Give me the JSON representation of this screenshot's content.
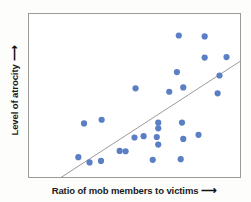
{
  "figure": {
    "background_color": "#fdfdfc",
    "plot_background_color": "#ffffff",
    "frame_color": "#9a9a9a"
  },
  "axes": {
    "x_label": "Ratio of mob members to victims",
    "y_label": "Level of atrocity",
    "x_arrow": "⟶",
    "y_arrow": "⟶"
  },
  "chart_data": {
    "type": "scatter",
    "title": "",
    "xlabel": "Ratio of mob members to victims",
    "ylabel": "Level of atrocity",
    "xlim": [
      0,
      10
    ],
    "ylim": [
      0,
      10
    ],
    "grid": false,
    "legend": null,
    "axis_ticks": {
      "x": [],
      "y": []
    },
    "marker": {
      "color": "#5b7fc4",
      "shape": "circle",
      "radius_px": 3.1
    },
    "points": [
      {
        "x": 7.09,
        "y": 8.66
      },
      {
        "x": 8.31,
        "y": 8.6
      },
      {
        "x": 8.31,
        "y": 7.31
      },
      {
        "x": 9.34,
        "y": 7.34
      },
      {
        "x": 7.0,
        "y": 6.43
      },
      {
        "x": 5.05,
        "y": 5.44
      },
      {
        "x": 7.3,
        "y": 5.49
      },
      {
        "x": 6.64,
        "y": 5.23
      },
      {
        "x": 8.92,
        "y": 5.13
      },
      {
        "x": 9.01,
        "y": 6.22
      },
      {
        "x": 6.12,
        "y": 3.34
      },
      {
        "x": 6.12,
        "y": 3.0
      },
      {
        "x": 7.24,
        "y": 3.35
      },
      {
        "x": 3.45,
        "y": 3.52
      },
      {
        "x": 5.43,
        "y": 2.52
      },
      {
        "x": 6.05,
        "y": 2.47
      },
      {
        "x": 5.0,
        "y": 2.44
      },
      {
        "x": 6.12,
        "y": 2.01
      },
      {
        "x": 7.3,
        "y": 2.35
      },
      {
        "x": 8.02,
        "y": 2.6
      },
      {
        "x": 4.58,
        "y": 1.6
      },
      {
        "x": 4.3,
        "y": 1.62
      },
      {
        "x": 5.86,
        "y": 1.08
      },
      {
        "x": 7.18,
        "y": 1.12
      },
      {
        "x": 3.42,
        "y": 1.01
      },
      {
        "x": 2.88,
        "y": 0.92
      },
      {
        "x": 2.62,
        "y": 3.3
      },
      {
        "x": 2.35,
        "y": 1.24
      }
    ],
    "trend_line": {
      "type": "linear-fit",
      "color": "#9b9b9b",
      "start": {
        "x": 1.53,
        "y": 0.0
      },
      "end": {
        "x": 10.0,
        "y": 7.1
      }
    }
  }
}
